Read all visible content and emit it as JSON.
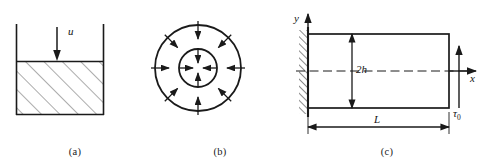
{
  "figure": {
    "width": 484,
    "height": 161,
    "background": "#ffffff",
    "line_color": "#1a1a1a",
    "hatch_color": "#555555"
  },
  "panels": [
    {
      "id": "a",
      "caption": "(a)",
      "title": "container-with-fluid",
      "labels": {
        "load": "u"
      },
      "geometry": {
        "wall_left_x": 16,
        "wall_right_x": 104,
        "wall_top_y": 24,
        "fluid_top_y": 62,
        "fluid_bottom_y": 115,
        "arrow_x": 57,
        "arrow_top_y": 27,
        "arrow_tip_y": 60
      }
    },
    {
      "id": "b",
      "caption": "(b)",
      "title": "concentric-circles-radial-load",
      "geometry": {
        "center_x": 48,
        "center_y": 68,
        "outer_radius": 43,
        "inner_radius": 19,
        "outer_arrow_count": 8,
        "inner_arrow_count": 4,
        "outer_arrow_start_offset": 23,
        "outer_arrow_end_offset": 4,
        "inner_arrow_start_offset": -1,
        "inner_arrow_end_offset": -14
      }
    },
    {
      "id": "c",
      "caption": "(c)",
      "title": "cantilever-beam-shear",
      "labels": {
        "height": "2h",
        "length": "L",
        "axis_x": "x",
        "axis_y": "y",
        "shear": "τ",
        "shear_sub": "0"
      },
      "geometry": {
        "beam_left_x": 18,
        "beam_right_x": 159,
        "beam_top_y": 34,
        "beam_bottom_y": 108,
        "midline_y": 71,
        "dim_h_x": 62,
        "dim_l_y": 127,
        "axis_y_top": 14,
        "axis_x_right": 186,
        "shear_arrow_x": 169,
        "shear_arrow_bottom_y": 108,
        "shear_arrow_top_y": 46
      }
    }
  ]
}
